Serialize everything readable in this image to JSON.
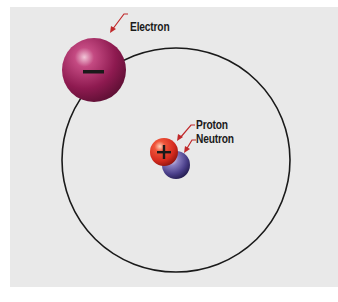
{
  "diagram": {
    "type": "atom-model",
    "labels": {
      "electron": "Electron",
      "proton": "Proton",
      "neutron": "Neutron"
    },
    "symbols": {
      "electron": "−",
      "proton": "+"
    },
    "colors": {
      "background": "#e9e9e9",
      "orbit": "#1a1a1a",
      "electron": "#9c1d5a",
      "proton": "#e03a2a",
      "neutron": "#4a3f8a",
      "leader": "#c0282a"
    }
  }
}
